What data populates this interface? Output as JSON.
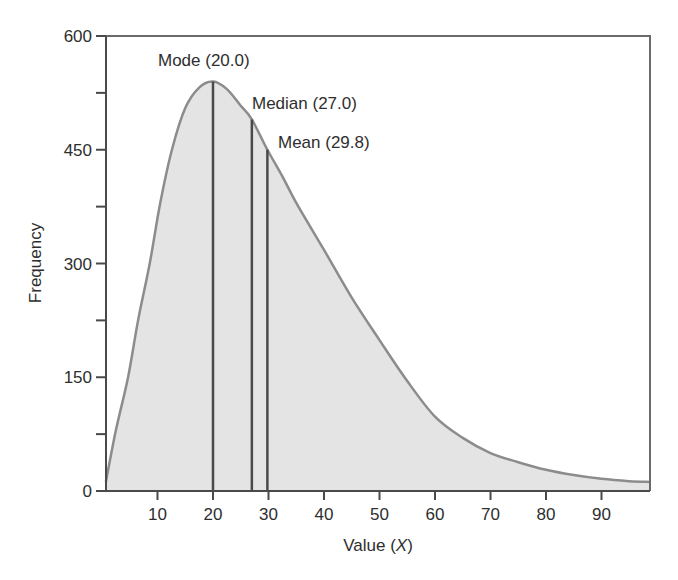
{
  "chart_data": {
    "type": "area",
    "title": "",
    "xlabel": "Value (X)",
    "xlabel_main": "Value (",
    "xlabel_var": "X",
    "xlabel_close": ")",
    "ylabel": "Frequency",
    "xlim": [
      0,
      100
    ],
    "ylim": [
      0,
      600
    ],
    "x_ticks": [
      10,
      20,
      30,
      40,
      50,
      60,
      70,
      80,
      90
    ],
    "y_ticks": [
      0,
      150,
      300,
      450,
      600
    ],
    "y_minor_ticks": [
      75,
      225,
      375,
      525
    ],
    "grid": false,
    "legend": null,
    "series": [
      {
        "name": "Positively skewed distribution",
        "x": [
          0.7,
          2.5,
          4.7,
          6.5,
          8.6,
          10.5,
          12.6,
          15,
          17.5,
          20,
          22.5,
          25,
          27,
          29.8,
          32.5,
          35,
          40,
          45,
          50,
          55,
          60,
          65,
          70,
          75,
          80,
          85,
          90,
          95,
          98.7
        ],
        "values": [
          12,
          80,
          150,
          225,
          300,
          380,
          450,
          505,
          532,
          540,
          530,
          508,
          490,
          450,
          415,
          380,
          318,
          255,
          199,
          145,
          98,
          70,
          50,
          38,
          28,
          21,
          16,
          13,
          12
        ]
      }
    ],
    "annotations": [
      {
        "label": "Mode (20.0)",
        "x": 20.0,
        "y_top": 540
      },
      {
        "label": "Median (27.0)",
        "x": 27.0,
        "y_top": 490
      },
      {
        "label": "Mean (29.8)",
        "x": 29.8,
        "y_top": 450
      }
    ],
    "colors": {
      "fill": "#e4e4e4",
      "curve": "#8c8c8c",
      "vline": "#4a4a4a",
      "axis": "#4a4a4a"
    }
  }
}
